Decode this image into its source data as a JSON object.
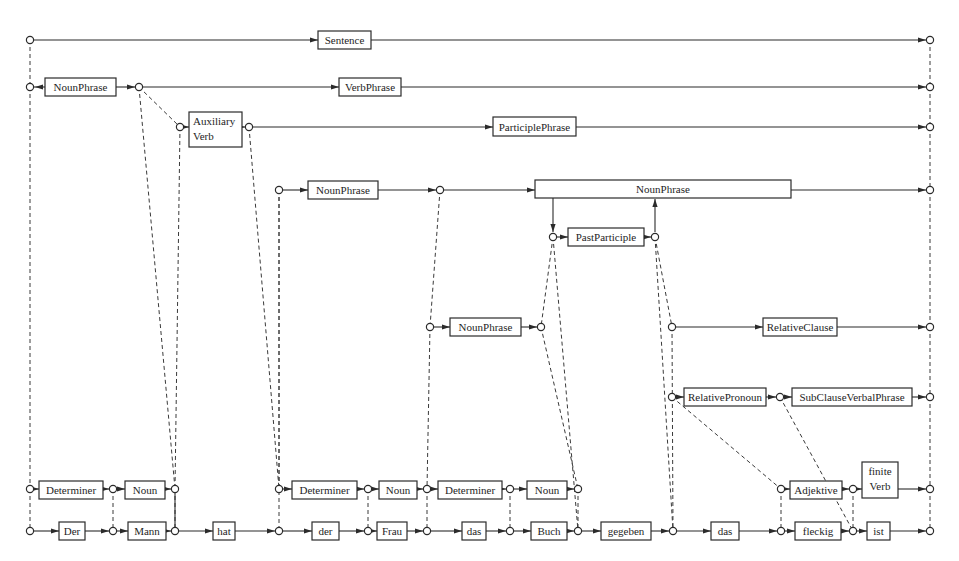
{
  "diagram": {
    "colors": {
      "line": "#2b2b2b",
      "background": "#ffffff"
    },
    "words": [
      "Der",
      "Mann",
      "hat",
      "der",
      "Frau",
      "das",
      "Buch",
      "gegeben",
      "das",
      "fleckig",
      "ist"
    ],
    "vertices": [
      {
        "id": "s0",
        "x": 30,
        "y": 40
      },
      {
        "id": "s1",
        "x": 930,
        "y": 40
      },
      {
        "id": "np0",
        "x": 30,
        "y": 87
      },
      {
        "id": "vp0",
        "x": 139,
        "y": 87
      },
      {
        "id": "vp1",
        "x": 930,
        "y": 87
      },
      {
        "id": "aux0",
        "x": 180,
        "y": 127
      },
      {
        "id": "pp0",
        "x": 249,
        "y": 127
      },
      {
        "id": "pp1",
        "x": 930,
        "y": 127
      },
      {
        "id": "np2a",
        "x": 279,
        "y": 190
      },
      {
        "id": "np2b",
        "x": 440,
        "y": 190
      },
      {
        "id": "np3b",
        "x": 930,
        "y": 190
      },
      {
        "id": "ptc0",
        "x": 553,
        "y": 237
      },
      {
        "id": "ptc1",
        "x": 655,
        "y": 237
      },
      {
        "id": "np4a",
        "x": 430,
        "y": 327
      },
      {
        "id": "np4b",
        "x": 541,
        "y": 327
      },
      {
        "id": "rc0",
        "x": 672,
        "y": 327
      },
      {
        "id": "rc1",
        "x": 930,
        "y": 327
      },
      {
        "id": "rp0",
        "x": 672,
        "y": 397
      },
      {
        "id": "scv0",
        "x": 780,
        "y": 397
      },
      {
        "id": "scv1",
        "x": 930,
        "y": 397
      },
      {
        "id": "d0",
        "x": 30,
        "y": 489
      },
      {
        "id": "d1",
        "x": 113,
        "y": 489
      },
      {
        "id": "d2",
        "x": 175,
        "y": 489
      },
      {
        "id": "d3",
        "x": 279,
        "y": 489
      },
      {
        "id": "d4",
        "x": 368,
        "y": 489
      },
      {
        "id": "d5",
        "x": 427,
        "y": 489
      },
      {
        "id": "d6",
        "x": 510,
        "y": 489
      },
      {
        "id": "d7",
        "x": 578,
        "y": 489
      },
      {
        "id": "a0",
        "x": 781,
        "y": 489
      },
      {
        "id": "a1",
        "x": 853,
        "y": 489
      },
      {
        "id": "a2",
        "x": 930,
        "y": 489
      },
      {
        "id": "w0",
        "x": 30,
        "y": 531
      },
      {
        "id": "w1",
        "x": 113,
        "y": 531
      },
      {
        "id": "w2",
        "x": 175,
        "y": 531
      },
      {
        "id": "w3",
        "x": 279,
        "y": 531
      },
      {
        "id": "w4",
        "x": 368,
        "y": 531
      },
      {
        "id": "w5",
        "x": 427,
        "y": 531
      },
      {
        "id": "w6",
        "x": 510,
        "y": 531
      },
      {
        "id": "w7",
        "x": 578,
        "y": 531
      },
      {
        "id": "w8",
        "x": 673,
        "y": 531
      },
      {
        "id": "w9",
        "x": 781,
        "y": 531
      },
      {
        "id": "w10",
        "x": 853,
        "y": 531
      },
      {
        "id": "w11",
        "x": 930,
        "y": 531
      }
    ],
    "nodes": [
      {
        "label": "Sentence",
        "x": 318,
        "y": 31,
        "w": 53,
        "h": 18,
        "from": "s0",
        "to": "s1"
      },
      {
        "label": "NounPhrase",
        "x": 45,
        "y": 78,
        "w": 71,
        "h": 18,
        "from": "np0",
        "to": "vp0",
        "reverse": true
      },
      {
        "label": "VerbPhrase",
        "x": 339,
        "y": 78,
        "w": 62,
        "h": 18,
        "from": "vp0",
        "to": "vp1"
      },
      {
        "label": "Auxiliary\nVerb",
        "x": 189,
        "y": 112,
        "w": 53,
        "h": 35,
        "from": "aux0",
        "to": "pp0"
      },
      {
        "label": "ParticiplePhrase",
        "x": 493,
        "y": 117,
        "w": 83,
        "h": 19,
        "from": "pp0",
        "to": "pp1"
      },
      {
        "label": "NounPhrase",
        "x": 308,
        "y": 181,
        "w": 70,
        "h": 18,
        "from": "np2a",
        "to": "np2b"
      },
      {
        "label": "NounPhrase",
        "x": 535,
        "y": 180,
        "w": 256,
        "h": 18,
        "from": "np2b",
        "to": "np3b",
        "wide": true
      },
      {
        "label": "PastParticiple",
        "x": 568,
        "y": 228,
        "w": 76,
        "h": 18,
        "from": "ptc0",
        "to": "ptc1"
      },
      {
        "label": "NounPhrase",
        "x": 450,
        "y": 318,
        "w": 71,
        "h": 18,
        "from": "np4a",
        "to": "np4b"
      },
      {
        "label": "RelativeClause",
        "x": 763,
        "y": 318,
        "w": 74,
        "h": 18,
        "from": "rc0",
        "to": "rc1"
      },
      {
        "label": "RelativePronoun",
        "x": 684,
        "y": 388,
        "w": 82,
        "h": 18,
        "from": "rp0",
        "to": "scv0"
      },
      {
        "label": "SubClauseVerbalPhrase",
        "x": 792,
        "y": 388,
        "w": 120,
        "h": 18,
        "from": "scv0",
        "to": "scv1"
      },
      {
        "label": "Determiner",
        "x": 39,
        "y": 481,
        "w": 64,
        "h": 18,
        "from": "d0",
        "to": "d1"
      },
      {
        "label": "Noun",
        "x": 125,
        "y": 481,
        "w": 40,
        "h": 18,
        "from": "d1",
        "to": "d2"
      },
      {
        "label": "Determiner",
        "x": 292,
        "y": 481,
        "w": 65,
        "h": 18,
        "from": "d3",
        "to": "d4"
      },
      {
        "label": "Noun",
        "x": 379,
        "y": 481,
        "w": 38,
        "h": 18,
        "from": "d4",
        "to": "d5"
      },
      {
        "label": "Determiner",
        "x": 438,
        "y": 481,
        "w": 64,
        "h": 18,
        "from": "d5",
        "to": "d6"
      },
      {
        "label": "Noun",
        "x": 527,
        "y": 481,
        "w": 40,
        "h": 18,
        "from": "d6",
        "to": "d7"
      },
      {
        "label": "Adjektive",
        "x": 790,
        "y": 481,
        "w": 52,
        "h": 18,
        "from": "a0",
        "to": "a1"
      },
      {
        "label": "finite\nVerb",
        "x": 862,
        "y": 462,
        "w": 36,
        "h": 36,
        "from": "a1",
        "to": "a2"
      },
      {
        "label": "Der",
        "x": 59,
        "y": 522,
        "w": 26,
        "h": 18,
        "from": "w0",
        "to": "w1"
      },
      {
        "label": "Mann",
        "x": 128,
        "y": 522,
        "w": 38,
        "h": 18,
        "from": "w1",
        "to": "w2"
      },
      {
        "label": "hat",
        "x": 213,
        "y": 522,
        "w": 22,
        "h": 18,
        "from": "w2",
        "to": "w3"
      },
      {
        "label": "der",
        "x": 312,
        "y": 522,
        "w": 27,
        "h": 18,
        "from": "w3",
        "to": "w4"
      },
      {
        "label": "Frau",
        "x": 377,
        "y": 522,
        "w": 30,
        "h": 18,
        "from": "w4",
        "to": "w5"
      },
      {
        "label": "das",
        "x": 462,
        "y": 522,
        "w": 24,
        "h": 18,
        "from": "w5",
        "to": "w6"
      },
      {
        "label": "Buch",
        "x": 531,
        "y": 522,
        "w": 36,
        "h": 18,
        "from": "w6",
        "to": "w7"
      },
      {
        "label": "gegeben",
        "x": 601,
        "y": 522,
        "w": 50,
        "h": 18,
        "from": "w7",
        "to": "w8"
      },
      {
        "label": "das",
        "x": 711,
        "y": 522,
        "w": 28,
        "h": 18,
        "from": "w8",
        "to": "w9"
      },
      {
        "label": "fleckig",
        "x": 795,
        "y": 522,
        "w": 46,
        "h": 18,
        "from": "w9",
        "to": "w10"
      },
      {
        "label": "ist",
        "x": 867,
        "y": 522,
        "w": 23,
        "h": 18,
        "from": "w10",
        "to": "w11"
      }
    ],
    "dashed_links": [
      [
        "s0",
        "np0"
      ],
      [
        "np0",
        "d0"
      ],
      [
        "d0",
        "w0"
      ],
      [
        "s1",
        "vp1"
      ],
      [
        "vp1",
        "pp1"
      ],
      [
        "pp1",
        "np3b"
      ],
      [
        "np3b",
        "rc1"
      ],
      [
        "rc1",
        "scv1"
      ],
      [
        "scv1",
        "a2"
      ],
      [
        "a2",
        "w11"
      ],
      [
        "vp0",
        "aux0"
      ],
      [
        "vp0",
        "d2"
      ],
      [
        "aux0",
        "d2"
      ],
      [
        "pp0",
        "d3"
      ],
      [
        "np2a",
        "d3"
      ],
      [
        "np2a",
        "w3"
      ],
      [
        "d1",
        "w1"
      ],
      [
        "d2",
        "w2"
      ],
      [
        "np2b",
        "np4a"
      ],
      [
        "np4a",
        "d5"
      ],
      [
        "d4",
        "w4"
      ],
      [
        "d5",
        "w5"
      ],
      [
        "d6",
        "w6"
      ],
      [
        "ptc0",
        "np4b"
      ],
      [
        "ptc0",
        "w7"
      ],
      [
        "np4b",
        "d7"
      ],
      [
        "d7",
        "w7"
      ],
      [
        "ptc1",
        "w8"
      ],
      [
        "ptc1",
        "rc0"
      ],
      [
        "rc0",
        "w8"
      ],
      [
        "rp0",
        "a0"
      ],
      [
        "a0",
        "w9"
      ],
      [
        "scv0",
        "w10"
      ],
      [
        "a1",
        "w10"
      ]
    ],
    "solid_links": [
      {
        "from": "d2",
        "to": "w2"
      }
    ],
    "branch_arrows": [
      {
        "x": 553,
        "y1": 198,
        "y2": 232,
        "dir": "down"
      },
      {
        "x": 655,
        "y1": 232,
        "y2": 199,
        "dir": "up"
      }
    ]
  }
}
